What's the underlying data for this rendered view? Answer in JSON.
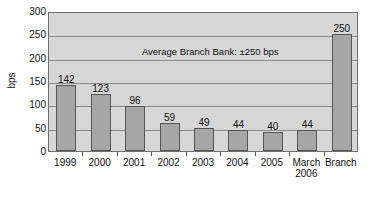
{
  "chart_data": {
    "type": "bar",
    "title": "",
    "subtitle": "",
    "xlabel": "",
    "ylabel": "bps",
    "ylim": [
      0,
      300
    ],
    "yticks": [
      0,
      50,
      100,
      150,
      200,
      250,
      300
    ],
    "grid": true,
    "legend": "none",
    "categories": [
      "1999",
      "2000",
      "2001",
      "2002",
      "2003",
      "2004",
      "2005",
      "March 2006",
      "Branch"
    ],
    "category_lines": [
      [
        "1999"
      ],
      [
        "2000"
      ],
      [
        "2001"
      ],
      [
        "2002"
      ],
      [
        "2003"
      ],
      [
        "2004"
      ],
      [
        "2005"
      ],
      [
        "March",
        "2006"
      ],
      [
        "Branch"
      ]
    ],
    "values": [
      142,
      123,
      96,
      59,
      49,
      44,
      40,
      44,
      250
    ],
    "value_labels": [
      "142",
      "123",
      "96",
      "59",
      "49",
      "44",
      "40",
      "44",
      "250"
    ],
    "annotations": [
      {
        "text": "Average Branch Bank: ±250 bps",
        "x_frac": 0.52,
        "y_value": 218
      }
    ],
    "colors": {
      "bar_fill": "#a6a6a6",
      "bar_edge": "#555555",
      "plot_background": "#d7d7d7",
      "gridline": "#8a8a8a",
      "axis": "#6f6f6f",
      "text": "#111111",
      "page_background": "#ffffff"
    }
  }
}
